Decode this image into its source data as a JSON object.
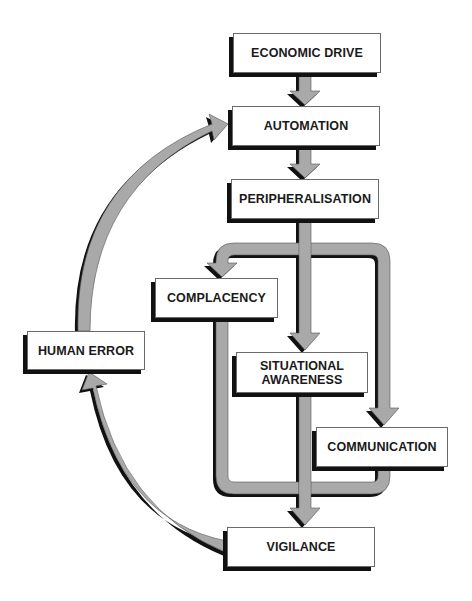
{
  "diagram": {
    "type": "flowchart",
    "colors": {
      "arrow_fill": "#a9a9a9",
      "arrow_shadow": "#111111",
      "box_fill": "#ffffff",
      "text": "#1a1a1a"
    },
    "nodes": {
      "economic_drive": {
        "label": "ECONOMIC DRIVE"
      },
      "automation": {
        "label": "AUTOMATION"
      },
      "peripheralisation": {
        "label": "PERIPHERALISATION"
      },
      "complacency": {
        "label": "COMPLACENCY"
      },
      "situational_awareness": {
        "line1": "SITUATIONAL",
        "line2": "AWARENESS"
      },
      "communication": {
        "label": "COMMUNICATION"
      },
      "vigilance": {
        "label": "VIGILANCE"
      },
      "human_error": {
        "label": "HUMAN ERROR"
      }
    },
    "edges": [
      {
        "from": "ECONOMIC DRIVE",
        "to": "AUTOMATION"
      },
      {
        "from": "AUTOMATION",
        "to": "PERIPHERALISATION"
      },
      {
        "from": "PERIPHERALISATION",
        "to": "COMPLACENCY"
      },
      {
        "from": "PERIPHERALISATION",
        "to": "SITUATIONAL AWARENESS"
      },
      {
        "from": "PERIPHERALISATION",
        "to": "COMMUNICATION"
      },
      {
        "from": "COMPLACENCY",
        "to": "VIGILANCE"
      },
      {
        "from": "SITUATIONAL AWARENESS",
        "to": "VIGILANCE"
      },
      {
        "from": "COMMUNICATION",
        "to": "VIGILANCE"
      },
      {
        "from": "VIGILANCE",
        "to": "HUMAN ERROR"
      },
      {
        "from": "HUMAN ERROR",
        "to": "AUTOMATION"
      }
    ]
  }
}
